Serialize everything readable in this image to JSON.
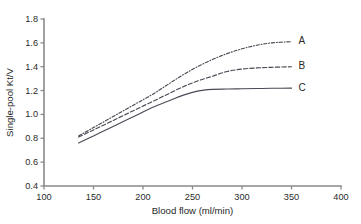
{
  "chart_data": {
    "type": "line",
    "title": "",
    "xlabel": "Blood flow (ml/min)",
    "ylabel": "Single-pool Kt/V",
    "xlim": [
      100,
      400
    ],
    "ylim": [
      0.4,
      1.8
    ],
    "xticks": [
      100,
      150,
      200,
      250,
      300,
      350,
      400
    ],
    "yticks": [
      0.4,
      0.6,
      0.8,
      1.0,
      1.2,
      1.4,
      1.6,
      1.8
    ],
    "xtick_labels": [
      "100",
      "150",
      "200",
      "250",
      "300",
      "350",
      "400"
    ],
    "ytick_labels": [
      "0.4",
      "0.6",
      "0.8",
      "1.0",
      "1.2",
      "1.4",
      "1.6",
      "1.8"
    ],
    "grid": false,
    "legend_position": "right-end-of-line",
    "axis_color": "#8a8a8a",
    "curve_color": "#4a4a55",
    "series": [
      {
        "name": "A",
        "label": "A",
        "linestyle": "dashdot",
        "x": [
          135,
          150,
          165,
          180,
          195,
          210,
          225,
          240,
          255,
          270,
          285,
          300,
          315,
          330,
          350
        ],
        "values": [
          0.82,
          0.89,
          0.96,
          1.03,
          1.1,
          1.17,
          1.25,
          1.33,
          1.4,
          1.46,
          1.51,
          1.55,
          1.58,
          1.6,
          1.61
        ]
      },
      {
        "name": "B",
        "label": "B",
        "linestyle": "dashed",
        "x": [
          135,
          150,
          165,
          180,
          195,
          210,
          225,
          240,
          255,
          270,
          285,
          300,
          315,
          330,
          350
        ],
        "values": [
          0.81,
          0.87,
          0.93,
          0.99,
          1.05,
          1.11,
          1.17,
          1.23,
          1.28,
          1.32,
          1.36,
          1.38,
          1.39,
          1.395,
          1.4
        ]
      },
      {
        "name": "C",
        "label": "C",
        "linestyle": "solid",
        "x": [
          135,
          150,
          165,
          180,
          195,
          210,
          225,
          240,
          255,
          270,
          285,
          300,
          315,
          330,
          350
        ],
        "values": [
          0.76,
          0.82,
          0.88,
          0.94,
          1.0,
          1.06,
          1.11,
          1.16,
          1.195,
          1.21,
          1.213,
          1.215,
          1.217,
          1.219,
          1.22
        ]
      }
    ]
  }
}
